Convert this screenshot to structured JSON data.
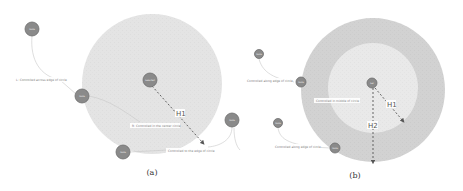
{
  "figure": {
    "panels": [
      {
        "id": "a",
        "caption": "(a)",
        "region": {
          "center": [
            152,
            84
          ],
          "radius": 70,
          "color": "#e4e4e4"
        },
        "nodes": [
          {
            "id": "center",
            "x": 150,
            "y": 80,
            "r": 7,
            "text": "Selected"
          },
          {
            "id": "top-left",
            "x": 32,
            "y": 29,
            "r": 7,
            "text": "Node"
          },
          {
            "id": "left",
            "x": 82,
            "y": 96,
            "r": 7,
            "text": "Node"
          },
          {
            "id": "bottom",
            "x": 123,
            "y": 152,
            "r": 7,
            "text": "Node"
          },
          {
            "id": "right",
            "x": 232,
            "y": 120,
            "r": 7,
            "text": "Node"
          }
        ],
        "labels": [
          {
            "text": "L: Controlled across edge of circle",
            "x": 16,
            "y": 80
          },
          {
            "text": "R: Controlled in the center circle",
            "x": 132,
            "y": 126
          },
          {
            "text": "Controlled to the edge of circle",
            "x": 168,
            "y": 151
          }
        ],
        "distances": [
          {
            "name": "H1",
            "from": [
              152,
              86
            ],
            "to": [
              203,
              143
            ],
            "label_pos": [
              179,
              116
            ]
          }
        ]
      },
      {
        "id": "b",
        "caption": "(b)",
        "outer_region": {
          "center": [
            373,
            90
          ],
          "radius": 72,
          "color": "#d2d2d2"
        },
        "inner_region": {
          "center": [
            373,
            88
          ],
          "radius": 45,
          "color": "#e9e9e9"
        },
        "nodes": [
          {
            "id": "center",
            "x": 372,
            "y": 83,
            "r": 5,
            "text": "Sel"
          },
          {
            "id": "n1",
            "x": 259,
            "y": 54,
            "r": 4.5,
            "text": "Node"
          },
          {
            "id": "n2",
            "x": 301,
            "y": 82,
            "r": 5,
            "text": "Node"
          },
          {
            "id": "n3",
            "x": 278,
            "y": 123,
            "r": 4.5,
            "text": "Node"
          },
          {
            "id": "n4",
            "x": 335,
            "y": 148,
            "r": 5,
            "text": "Node"
          },
          {
            "id": "n5",
            "x": 234,
            "y": 120,
            "r": 7,
            "text": "Node"
          }
        ],
        "labels": [
          {
            "text": "Controlled along edge of circle",
            "x": 247,
            "y": 81
          },
          {
            "text": "Controlled in middle of circle",
            "x": 316,
            "y": 101
          },
          {
            "text": "Controlled along edge of circle",
            "x": 275,
            "y": 147
          }
        ],
        "distances": [
          {
            "name": "H1",
            "from": [
              375,
              88
            ],
            "to": [
              403,
              121
            ],
            "label_pos": [
              389,
              107
            ]
          },
          {
            "name": "H2",
            "from": [
              373,
              88
            ],
            "to": [
              373,
              162
            ],
            "label_pos": [
              369,
              128
            ]
          }
        ]
      }
    ]
  }
}
